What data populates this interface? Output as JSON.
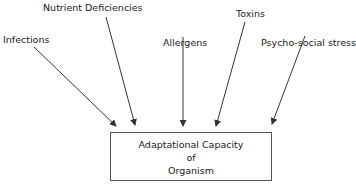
{
  "diagram": {
    "sources": [
      {
        "label": "Infections"
      },
      {
        "label": "Nutrient Deficiencies"
      },
      {
        "label": "Allergens"
      },
      {
        "label": "Toxins"
      },
      {
        "label": "Psycho-social stress"
      }
    ],
    "target": {
      "lines": [
        "Adaptational Capacity",
        "of",
        "Organism"
      ]
    },
    "colors": {
      "line": "#333333",
      "text": "#1a1a1a",
      "background": "#ffffff"
    }
  }
}
